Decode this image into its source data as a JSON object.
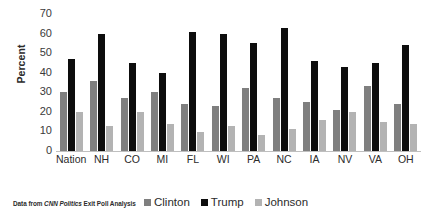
{
  "chart_data": {
    "type": "bar",
    "title": "",
    "xlabel": "",
    "ylabel": "Percent",
    "ylim": [
      0,
      70
    ],
    "yticks": [
      0,
      10,
      20,
      30,
      40,
      50,
      60,
      70
    ],
    "grid": false,
    "legend_position": "bottom",
    "categories": [
      "Nation",
      "NH",
      "CO",
      "MI",
      "FL",
      "WI",
      "PA",
      "NC",
      "IA",
      "NV",
      "VA",
      "OH"
    ],
    "series": [
      {
        "name": "Clinton",
        "color": "#7f7f7f",
        "values": [
          30,
          36,
          27,
          30,
          24,
          23,
          32,
          27,
          25,
          21,
          33,
          24
        ]
      },
      {
        "name": "Trump",
        "color": "#0d0d0d",
        "values": [
          47,
          60,
          45,
          40,
          61,
          60,
          55,
          63,
          46,
          43,
          45,
          54
        ]
      },
      {
        "name": "Johnson",
        "color": "#b3b3b3",
        "values": [
          20,
          13,
          20,
          14,
          9.5,
          13,
          8,
          11,
          16,
          20,
          15,
          14
        ]
      }
    ],
    "annotations": {
      "source_prefix": "Data from ",
      "source_emphasis": "CNN Politics",
      "source_suffix": " Exit Poll Analysis"
    }
  }
}
